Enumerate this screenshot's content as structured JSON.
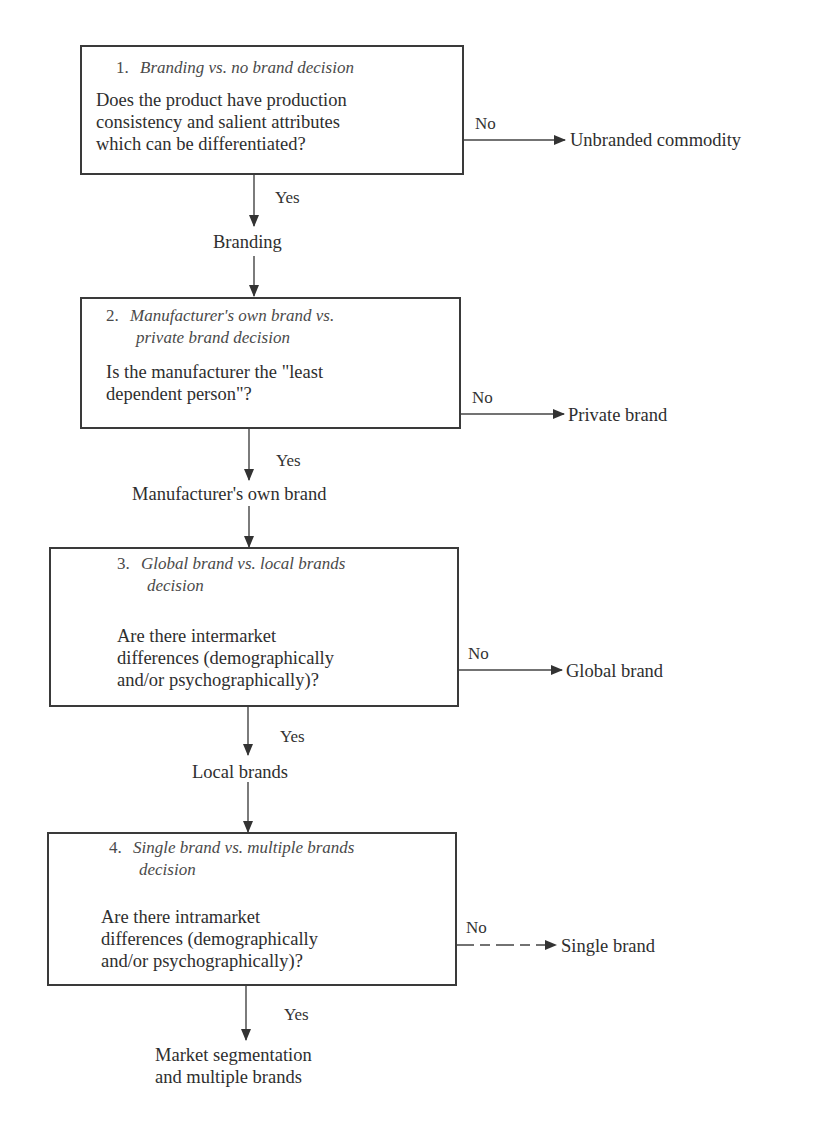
{
  "decisions": [
    {
      "number": "1.",
      "title": "Branding vs. no brand decision",
      "title_line2": "",
      "question": [
        "Does the product have production",
        "consistency and salient attributes",
        "which can be differentiated?"
      ],
      "no_label": "No",
      "no_outcome": "Unbranded commodity",
      "yes_label": "Yes",
      "yes_outcome": "Branding"
    },
    {
      "number": "2.",
      "title": "Manufacturer's own brand vs.",
      "title_line2": "private brand decision",
      "question": [
        "Is the manufacturer the \"least",
        "dependent person\"?"
      ],
      "no_label": "No",
      "no_outcome": "Private brand",
      "yes_label": "Yes",
      "yes_outcome": "Manufacturer's own brand"
    },
    {
      "number": "3.",
      "title": "Global brand vs. local brands",
      "title_line2": "decision",
      "question": [
        "Are there intermarket",
        "differences (demographically",
        "and/or psychographically)?"
      ],
      "no_label": "No",
      "no_outcome": "Global brand",
      "yes_label": "Yes",
      "yes_outcome": "Local brands"
    },
    {
      "number": "4.",
      "title": "Single brand vs. multiple brands",
      "title_line2": "decision",
      "question": [
        "Are there intramarket",
        "differences (demographically",
        "and/or psychographically)?"
      ],
      "no_label": "No",
      "no_outcome": "Single brand",
      "yes_label": "Yes",
      "yes_outcome_lines": [
        "Market segmentation",
        "and multiple brands"
      ]
    }
  ],
  "colors": {
    "line": "#3a3a3a",
    "text": "#2e2e2e",
    "background": "#ffffff"
  }
}
